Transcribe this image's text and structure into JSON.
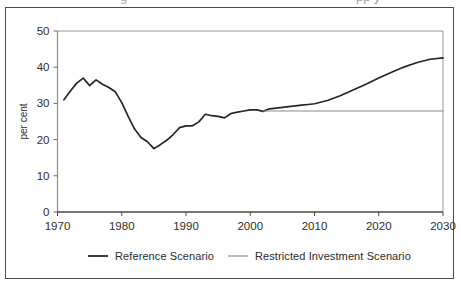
{
  "figure": {
    "background_color": "#ffffff",
    "frame_color": "#4a4a4a",
    "ghost_top_text": "g",
    "ghost_top_text_right": "pp y"
  },
  "chart_data": {
    "type": "line",
    "title": "",
    "xlabel": "",
    "ylabel": "per cent",
    "xlim": [
      1970,
      2030
    ],
    "ylim": [
      0,
      50
    ],
    "xticks": [
      1970,
      1980,
      1990,
      2000,
      2010,
      2020,
      2030
    ],
    "yticks": [
      0,
      10,
      20,
      30,
      40,
      50
    ],
    "xtick_labels": [
      "1970",
      "1980",
      "1990",
      "2000",
      "2010",
      "2020",
      "2030"
    ],
    "ytick_labels": [
      "0",
      "10",
      "20",
      "30",
      "40",
      "50"
    ],
    "grid": false,
    "legend_position": "below",
    "series": [
      {
        "name": "Reference Scenario",
        "color": "#262626",
        "line_width": 1.7,
        "x": [
          1971,
          1972,
          1973,
          1974,
          1975,
          1976,
          1977,
          1978,
          1979,
          1980,
          1981,
          1982,
          1983,
          1984,
          1985,
          1986,
          1987,
          1988,
          1989,
          1990,
          1991,
          1992,
          1993,
          1994,
          1995,
          1996,
          1997,
          1998,
          1999,
          2000,
          2001,
          2002,
          2003,
          2004,
          2005,
          2006,
          2007,
          2008,
          2009,
          2010,
          2012,
          2014,
          2016,
          2018,
          2020,
          2022,
          2024,
          2026,
          2028,
          2030
        ],
        "values": [
          31.0,
          33.4,
          35.6,
          37.0,
          34.9,
          36.5,
          35.3,
          34.4,
          33.2,
          30.2,
          26.4,
          22.9,
          20.6,
          19.4,
          17.5,
          18.6,
          19.8,
          21.4,
          23.3,
          23.8,
          23.8,
          24.9,
          27.0,
          26.6,
          26.4,
          26.0,
          27.2,
          27.6,
          27.9,
          28.2,
          28.2,
          27.8,
          28.5,
          28.7,
          28.9,
          29.1,
          29.3,
          29.5,
          29.7,
          29.9,
          30.8,
          32.1,
          33.7,
          35.3,
          37.0,
          38.6,
          40.1,
          41.3,
          42.2,
          42.6
        ]
      },
      {
        "name": "Restricted Investment Scenario",
        "color": "#8a8a8a",
        "line_width": 1.1,
        "x": [
          2002,
          2006,
          2010,
          2014,
          2018,
          2022,
          2026,
          2030
        ],
        "values": [
          27.9,
          27.9,
          27.9,
          27.9,
          27.9,
          27.9,
          27.9,
          27.9
        ]
      }
    ]
  },
  "legend": {
    "items": [
      {
        "label": "Reference Scenario",
        "color": "#262626",
        "line_width": 1.8
      },
      {
        "label": "Restricted Investment Scenario",
        "color": "#8a8a8a",
        "line_width": 1.2
      }
    ]
  }
}
